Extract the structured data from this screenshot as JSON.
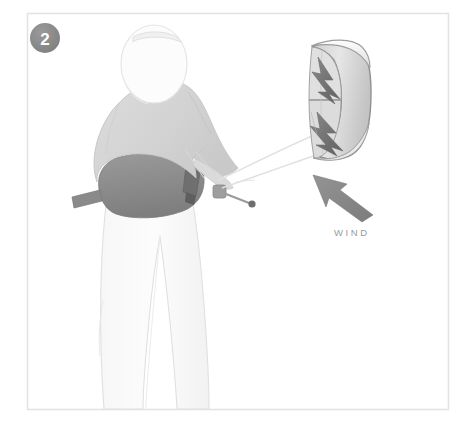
{
  "illustration": {
    "title": "Kiteboarding setup step diagram",
    "step_badge": {
      "number": "2",
      "shape": "circle",
      "fill_color": "#8c8c8c",
      "text_color": "#ffffff"
    },
    "frame": {
      "border_color": "#e3e3e3",
      "background_color": "#ffffff"
    },
    "labels": {
      "wind": "WIND"
    },
    "wind_arrow": {
      "name": "wind-direction-arrow",
      "direction": "up-left",
      "fill_color": "#8b8b8b"
    },
    "kite": {
      "name": "kite-canopy",
      "graphic": "lightning-bolt",
      "canopy_color": "#d8d8d8",
      "leading_edge_color": "#f2f2f2",
      "outline_color": "#8f8f8f",
      "bolt_color": "#7d7d7d"
    },
    "rider": {
      "name": "kitesurfer-figure",
      "pose": "back-view-standing",
      "helmet_color": "#fbfbfb",
      "jacket_color": "#d5d5d5",
      "harness_color": "#8e8e8e",
      "pants_color": "#fafafa",
      "outline_color": "#cfcfcf"
    },
    "control_bar": {
      "name": "control-bar",
      "color": "#6f6f6f"
    },
    "lines": {
      "name": "kite-lines",
      "color": "#dcdcdc",
      "count": "2"
    }
  }
}
